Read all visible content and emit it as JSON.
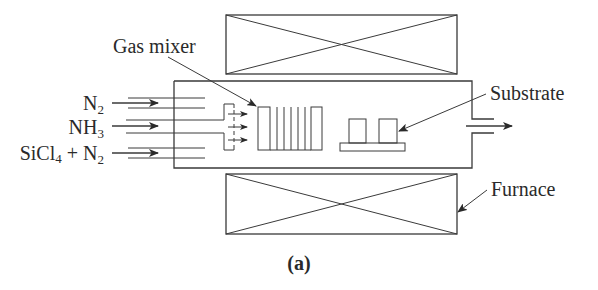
{
  "figure": {
    "caption": "(a)",
    "labels": {
      "gas_mixer": "Gas mixer",
      "substrate": "Substrate",
      "furnace": "Furnace"
    },
    "inlets": [
      {
        "formula": "N",
        "subscript": "2",
        "suffix": "",
        "suffix_sub": ""
      },
      {
        "formula": "NH",
        "subscript": "3",
        "suffix": "",
        "suffix_sub": ""
      },
      {
        "formula": "SiCl",
        "subscript": "4",
        "suffix": " + N",
        "suffix_sub": "2"
      }
    ],
    "colors": {
      "line": "#3a3a3a",
      "text": "#2a2a2a",
      "background": "#ffffff"
    }
  }
}
